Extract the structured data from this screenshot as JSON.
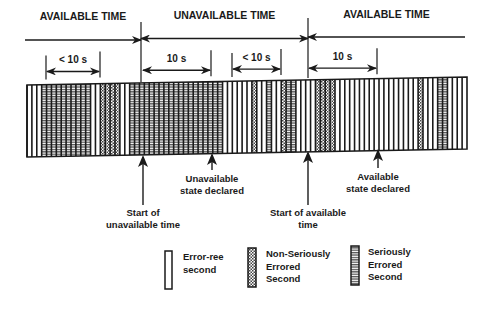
{
  "diagram": {
    "periods": [
      {
        "label": "AVAILABLE TIME",
        "x_start": 25,
        "x_end": 141
      },
      {
        "label": "UNAVAILABLE TIME",
        "x_start": 141,
        "x_end": 308
      },
      {
        "label": "AVAILABLE TIME",
        "x_start": 308,
        "x_end": 465
      }
    ],
    "dimensions": [
      {
        "label": "< 10 s",
        "x_start": 46,
        "x_end": 100
      },
      {
        "label": "10 s",
        "x_start": 142,
        "x_end": 211
      },
      {
        "label": "< 10 s",
        "x_start": 232,
        "x_end": 281
      },
      {
        "label": "10 s",
        "x_start": 308,
        "x_end": 377
      }
    ],
    "annotations": [
      {
        "id": "start-unavailable",
        "lines": [
          "Start of",
          "unavailable time"
        ],
        "x": 143
      },
      {
        "id": "unavailable-declared",
        "lines": [
          "Unavailable",
          "state declared"
        ],
        "x": 212
      },
      {
        "id": "start-available",
        "lines": [
          "Start of available",
          "time"
        ],
        "x": 308
      },
      {
        "id": "available-declared",
        "lines": [
          "Available",
          "state declared"
        ],
        "x": 378
      }
    ],
    "strip_sequence": "EEESSSSSSSSSSEENNNNEESSSSSSSSSSSSSSSSSSSEEEEEENEESEENSSEEEENNNNEEEEEEEEEEEEEEEEENEEESSEEEE",
    "legend": [
      {
        "key": "E",
        "label_lines": [
          "Error-ree",
          "second"
        ]
      },
      {
        "key": "N",
        "label_lines": [
          "Non-Seriously",
          "Errored",
          "Second"
        ]
      },
      {
        "key": "S",
        "label_lines": [
          "Seriously",
          "Errored",
          "Second"
        ]
      }
    ],
    "colors": {
      "ink": "#1a1a1a",
      "background": "#ffffff",
      "fill_gray": "#8a8a8a"
    }
  }
}
